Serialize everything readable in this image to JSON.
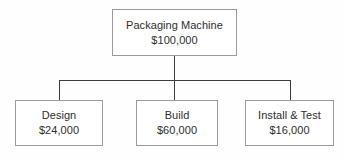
{
  "diagram": {
    "type": "work-breakdown-structure",
    "background_color": "#fefefe",
    "box_border_color": "#9b9b9b",
    "connector_color": "#3c3c3c",
    "text_color": "#2e2e2e",
    "root": {
      "title": "Packaging Machine",
      "value": "$100,000"
    },
    "children": [
      {
        "title": "Design",
        "value": "$24,000"
      },
      {
        "title": "Build",
        "value": "$60,000"
      },
      {
        "title": "Install & Test",
        "value": "$16,000"
      }
    ]
  }
}
